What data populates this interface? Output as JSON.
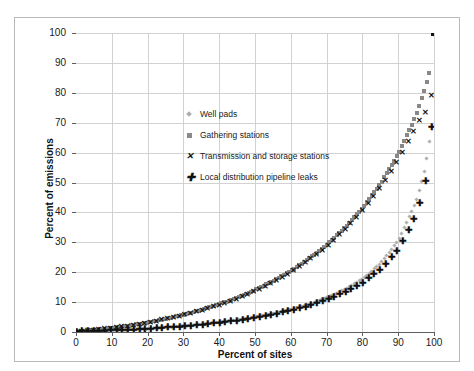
{
  "chart_data": {
    "type": "line",
    "title": "",
    "xlabel": "Percent of sites",
    "ylabel": "Percent of emissions",
    "xlim": [
      0,
      100
    ],
    "ylim": [
      0,
      100
    ],
    "xticks": [
      0,
      10,
      20,
      30,
      40,
      50,
      60,
      70,
      80,
      90,
      100
    ],
    "yticks": [
      0,
      10,
      20,
      30,
      40,
      50,
      60,
      70,
      80,
      90,
      100
    ],
    "grid": true,
    "legend_position": "upper-left-inside",
    "x": [
      0,
      5,
      10,
      15,
      20,
      25,
      30,
      35,
      40,
      45,
      50,
      55,
      60,
      65,
      70,
      75,
      80,
      85,
      90,
      95,
      97,
      98,
      99,
      100
    ],
    "series": [
      {
        "name": "Well pads",
        "marker": "diamond",
        "color": "#b0b0b0",
        "values": [
          0,
          0.2,
          0.4,
          0.7,
          1.0,
          1.4,
          1.9,
          2.5,
          3.2,
          4.0,
          5.0,
          6.2,
          7.6,
          9.3,
          11.5,
          14.2,
          17.8,
          22.8,
          30.5,
          43.5,
          52.0,
          58.0,
          66.0,
          100
        ]
      },
      {
        "name": "Gathering stations",
        "marker": "square",
        "color": "#888888",
        "values": [
          0,
          0.6,
          1.3,
          2.2,
          3.2,
          4.4,
          5.8,
          7.4,
          9.3,
          11.5,
          14.0,
          17.0,
          20.5,
          24.5,
          29.2,
          34.8,
          41.5,
          49.5,
          59.5,
          72.5,
          79.5,
          83.5,
          88.0,
          100
        ]
      },
      {
        "name": "Transmission and storage stations",
        "marker": "x",
        "color": "#111111",
        "values": [
          0,
          0.6,
          1.3,
          2.1,
          3.1,
          4.3,
          5.6,
          7.2,
          9.0,
          11.1,
          13.6,
          16.5,
          19.9,
          23.9,
          28.5,
          34.0,
          40.5,
          48.2,
          57.5,
          68.5,
          73.0,
          73.5,
          73.8,
          100
        ]
      },
      {
        "name": "Local distribution pipeline leaks",
        "marker": "plus",
        "color": "#111111",
        "values": [
          0,
          0.2,
          0.4,
          0.6,
          0.9,
          1.3,
          1.7,
          2.3,
          2.9,
          3.7,
          4.6,
          5.7,
          7.0,
          8.6,
          10.6,
          13.1,
          16.3,
          20.8,
          27.5,
          39.0,
          47.0,
          52.5,
          60.5,
          100
        ]
      }
    ]
  },
  "legend": {
    "items": [
      {
        "label": "Well pads",
        "marker": "diamond"
      },
      {
        "label": "Gathering stations",
        "marker": "square"
      },
      {
        "label": "Transmission and storage stations",
        "marker": "x"
      },
      {
        "label": "Local distribution pipeline leaks",
        "marker": "plus"
      }
    ]
  },
  "glyphs": {
    "x_mark": "✕",
    "plus_mark": "✚"
  }
}
